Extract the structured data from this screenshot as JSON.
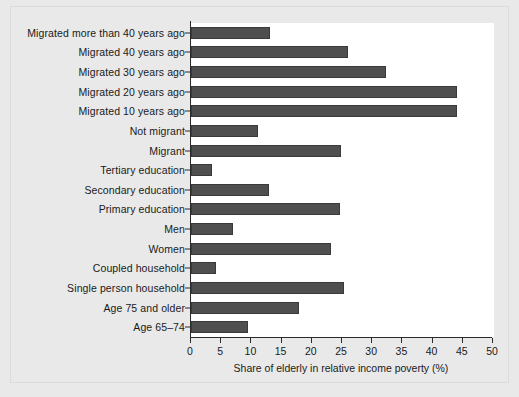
{
  "chart_data": {
    "type": "bar",
    "orientation": "horizontal",
    "title": "",
    "subtitle": "",
    "xlabel": "Share of elderly in relative income poverty (%)",
    "ylabel": "",
    "xlim": [
      0,
      50
    ],
    "xticks": [
      0,
      5,
      10,
      15,
      20,
      25,
      30,
      35,
      40,
      45,
      50
    ],
    "grid": false,
    "legend": null,
    "bar_color": "#4f4f4f",
    "panel_color": "#ffffff",
    "background_color": "#e9e9e9",
    "categories": [
      "Migrated more than 40 years ago",
      "Migrated 40 years ago",
      "Migrated 30 years ago",
      "Migrated 20 years ago",
      "Migrated 10 years ago",
      "Not migrant",
      "Migrant",
      "Tertiary education",
      "Secondary education",
      "Primary education",
      "Men",
      "Women",
      "Coupled household",
      "Single person household",
      "Age 75 and older",
      "Age 65–74"
    ],
    "values": [
      13.1,
      26.0,
      32.3,
      44.0,
      44.0,
      11.1,
      24.8,
      3.5,
      12.9,
      24.7,
      6.9,
      23.2,
      4.2,
      25.4,
      17.9,
      9.5
    ]
  }
}
